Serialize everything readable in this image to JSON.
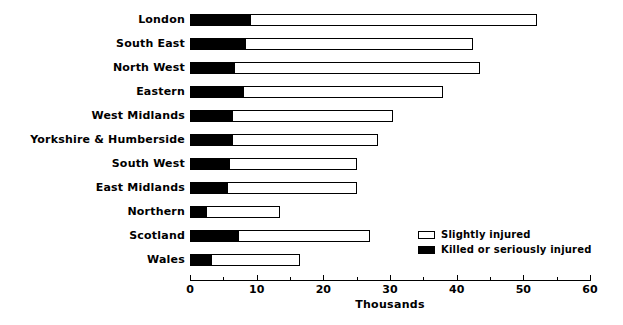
{
  "chart_data": {
    "type": "bar",
    "orientation": "horizontal",
    "stacked": true,
    "title": "",
    "xlabel": "Thousands",
    "ylabel": "",
    "xlim": [
      0,
      60
    ],
    "xticks": [
      0,
      10,
      20,
      30,
      40,
      50,
      60
    ],
    "xtick_labels": [
      "0",
      "10",
      "20",
      "30",
      "40",
      "50",
      "60"
    ],
    "minor_tick_step": 5,
    "grid": false,
    "legend_position": "inside-right",
    "categories": [
      "London",
      "South East",
      "North West",
      "Eastern",
      "West Midlands",
      "Yorkshire & Humberside",
      "South West",
      "East Midlands",
      "Northern",
      "Scotland",
      "Wales"
    ],
    "series": [
      {
        "name": "Killed or seriously injured",
        "color": "#000000",
        "values": [
          9.0,
          8.2,
          6.6,
          8.0,
          6.3,
          6.3,
          5.8,
          5.6,
          2.4,
          7.2,
          3.1
        ]
      },
      {
        "name": "Slightly injured",
        "color": "#ffffff",
        "values": [
          43.0,
          34.3,
          36.9,
          30.0,
          24.2,
          21.9,
          19.2,
          19.4,
          11.1,
          19.8,
          13.4
        ]
      }
    ],
    "totals": [
      52.0,
      42.5,
      43.5,
      38.0,
      30.5,
      28.2,
      25.0,
      25.0,
      13.5,
      27.0,
      16.5
    ]
  },
  "legend": {
    "items": [
      {
        "label": "Slightly injured",
        "swatch": "light-swatch-icon"
      },
      {
        "label": "Killed or seriously injured",
        "swatch": "dark-swatch-icon"
      }
    ]
  }
}
